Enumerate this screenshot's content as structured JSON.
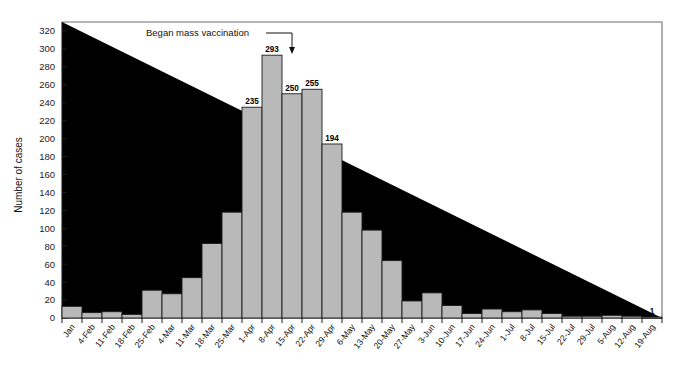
{
  "chart_data": {
    "type": "bar",
    "title": "",
    "xlabel": "",
    "ylabel": "Number of cases",
    "ylim": [
      0,
      330
    ],
    "ytick_step": 20,
    "yticks": [
      0,
      20,
      40,
      60,
      80,
      100,
      120,
      140,
      160,
      180,
      200,
      220,
      240,
      260,
      280,
      300,
      320
    ],
    "grid": false,
    "legend": null,
    "categories": [
      "Jan",
      "4-Feb",
      "11-Feb",
      "18-Feb",
      "25-Feb",
      "4-Mar",
      "11-Mar",
      "18-Mar",
      "25-Mar",
      "1-Apr",
      "8-Apr",
      "15-Apr",
      "22-Apr",
      "29-Apr",
      "6-May",
      "13-May",
      "20-May",
      "27-May",
      "3-Jun",
      "10-Jun",
      "17-Jun",
      "24-Jun",
      "1-Jul",
      "8-Jul",
      "15-Jul",
      "22-Jul",
      "29-Jul",
      "5-Aug",
      "12-Aug",
      "19-Aug"
    ],
    "values": [
      13,
      6,
      7,
      4,
      31,
      27,
      45,
      83,
      118,
      235,
      293,
      250,
      255,
      194,
      118,
      98,
      64,
      19,
      28,
      14,
      5,
      10,
      7,
      9,
      5,
      2,
      2,
      3,
      2,
      1
    ],
    "bar_color": "#b9b9b9",
    "bar_edge_color": "#1c1c1c",
    "annotations": [
      {
        "name": "mass-vaccination-annotation",
        "text": "Began mass vaccination",
        "points_to_category": "15-Apr",
        "arrow": "down"
      }
    ]
  },
  "axis": {
    "y_title": "Number of cases"
  }
}
